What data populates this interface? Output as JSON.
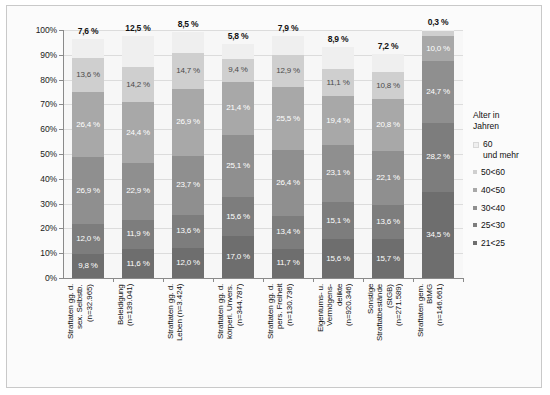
{
  "chart_data": {
    "type": "bar",
    "subtype": "stacked-percentage-column",
    "title": "",
    "xlabel": "",
    "ylabel": "",
    "ylim": [
      0,
      100
    ],
    "ytick_labels": [
      "0%",
      "10%",
      "20%",
      "30%",
      "40%",
      "50%",
      "60%",
      "70%",
      "80%",
      "90%",
      "100%"
    ],
    "ytick_values": [
      0,
      10,
      20,
      30,
      40,
      50,
      60,
      70,
      80,
      90,
      100
    ],
    "grid": true,
    "legend_position": "right",
    "legend_title": "Alter in\nJahren",
    "categories": [
      "Straftaten gg. d.\nsex. Selbstb.\n(n=32.965)",
      "Beleidigung\n(n=139.041)",
      "Straftaten gg. d.\nLeben (n=3.424)",
      "Straftaten gg. d.\nkörperl. Unvers.\n(n=344.787)",
      "Straftaten gg. d.\npers. Freiheit\n(n=130.736)",
      "Eigentums- u.\nVermögens-\ndelikte\n(n=920.346)",
      "Sonstige\nStraftatbestände\n(StGB)\n(n=271.589)",
      "Straftaten gem.\nBtMG\n(n=146.661)"
    ],
    "series": [
      {
        "name": "21<25",
        "color": "#6e6e6e",
        "values": [
          9.8,
          11.6,
          12.0,
          17.0,
          11.7,
          15.6,
          15.7,
          34.5
        ]
      },
      {
        "name": "25<30",
        "color": "#7d7d7d",
        "values": [
          12.0,
          11.9,
          13.6,
          15.6,
          13.4,
          15.1,
          13.6,
          28.2
        ]
      },
      {
        "name": "30<40",
        "color": "#8f8f8f",
        "values": [
          26.9,
          22.9,
          23.7,
          25.1,
          26.4,
          23.1,
          22.1,
          24.7
        ]
      },
      {
        "name": "40<50",
        "color": "#a8a8a8",
        "values": [
          26.4,
          24.4,
          26.9,
          21.4,
          25.5,
          19.4,
          20.8,
          10.0
        ]
      },
      {
        "name": "50<60",
        "color": "#cfcfcf",
        "values": [
          13.6,
          14.2,
          14.7,
          9.4,
          12.9,
          11.1,
          10.8,
          2.3
        ]
      },
      {
        "name": "60\nund mehr",
        "color": "#efefef",
        "values": [
          7.6,
          12.5,
          8.5,
          5.8,
          7.9,
          8.9,
          7.2,
          0.3
        ]
      }
    ],
    "data_labels": {
      "bar1": [
        "9,8 %",
        "12,0 %",
        "26,9 %",
        "26,4 %",
        "13,6 %",
        "7,6 %"
      ],
      "bar2": [
        "11,6 %",
        "11,9 %",
        "22,9 %",
        "24,4 %",
        "14,2 %",
        "12,5 %"
      ],
      "bar3": [
        "12,0 %",
        "13,6 %",
        "23,7 %",
        "26,9 %",
        "14,7 %",
        "8,5 %"
      ],
      "bar4": [
        "17,0 %",
        "15,6 %",
        "25,1 %",
        "21,4 %",
        "9,4 %",
        "5,8 %"
      ],
      "bar5": [
        "11,7 %",
        "13,4 %",
        "26,4 %",
        "25,5 %",
        "12,9 %",
        "7,9 %"
      ],
      "bar6": [
        "15,6 %",
        "15,1 %",
        "23,1 %",
        "19,4 %",
        "11,1 %",
        "8,9 %"
      ],
      "bar7": [
        "15,7 %",
        "13,6 %",
        "22,1 %",
        "20,8 %",
        "10,8 %",
        "7,2 %"
      ],
      "bar8": [
        "34,5 %",
        "28,2 %",
        "24,7 %",
        "10,0 %",
        "",
        "0,3 %"
      ]
    },
    "legend_entries": [
      {
        "label": "60\nund mehr",
        "color": "#efefef"
      },
      {
        "label": "50<60",
        "color": "#cfcfcf"
      },
      {
        "label": "40<50",
        "color": "#a8a8a8"
      },
      {
        "label": "30<40",
        "color": "#8f8f8f"
      },
      {
        "label": "25<30",
        "color": "#7d7d7d"
      },
      {
        "label": "21<25",
        "color": "#6e6e6e"
      }
    ],
    "colors": {
      "plot_background": "#f7f7f7",
      "frame_border": "#c9c9c9",
      "gridline": "#dcdcdc",
      "axis": "#8a8a8a",
      "label_text": "#101010"
    }
  }
}
